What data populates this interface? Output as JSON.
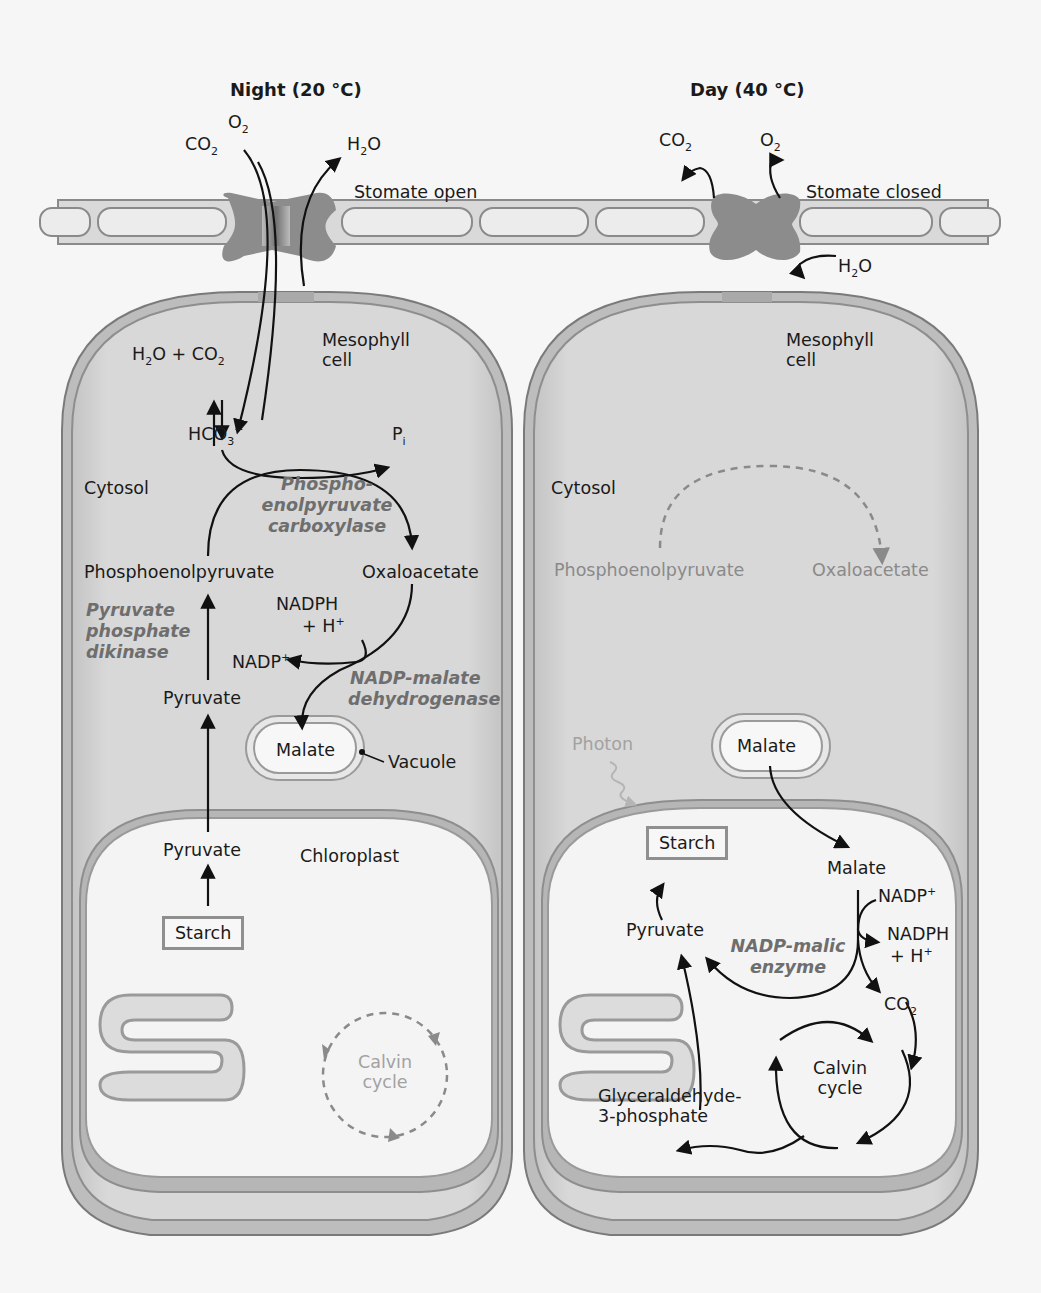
{
  "panels": {
    "night": {
      "title": "Night (20 °C)",
      "gases": {
        "o2": "O",
        "o2_sub": "2",
        "co2": "CO",
        "co2_sub": "2",
        "h2o_h": "H",
        "h2o_sub": "2",
        "h2o_o": "O"
      },
      "stomate_label": "Stomate open",
      "cell_label_line1": "Mesophyll",
      "cell_label_line2": "cell",
      "cytosol_label": "Cytosol",
      "reaction_h2o_co2": {
        "h": "H",
        "sub1": "2",
        "mid": "O + CO",
        "sub2": "2"
      },
      "hco3": {
        "main": "HCO",
        "sub": "3",
        "sup": "−"
      },
      "pi": {
        "main": "P",
        "sub": "i"
      },
      "enzyme_pepc": [
        "Phospho-",
        "enolpyruvate",
        "carboxylase"
      ],
      "phosphoenolpyruvate": "Phosphoenolpyruvate",
      "oxaloacetate": "Oxaloacetate",
      "nadph": "NADPH",
      "h_plus": "+ H",
      "h_plus_sup": "+",
      "nadp": "NADP",
      "nadp_sup": "+",
      "enzyme_ppdk": [
        "Pyruvate",
        "phosphate",
        "dikinase"
      ],
      "enzyme_nadp_mdh": [
        "NADP-malate",
        "dehydrogenase"
      ],
      "pyruvate_cytosol": "Pyruvate",
      "malate": "Malate",
      "vacuole": "Vacuole",
      "pyruvate_chloroplast": "Pyruvate",
      "chloroplast": "Chloroplast",
      "starch": "Starch",
      "calvin_line1": "Calvin",
      "calvin_line2": "cycle"
    },
    "day": {
      "title": "Day (40 °C)",
      "gases": {
        "co2": "CO",
        "co2_sub": "2",
        "o2": "O",
        "o2_sub": "2",
        "h2o_h": "H",
        "h2o_sub": "2",
        "h2o_o": "O"
      },
      "stomate_label": "Stomate closed",
      "cell_label_line1": "Mesophyll",
      "cell_label_line2": "cell",
      "cytosol_label": "Cytosol",
      "phosphoenolpyruvate": "Phosphoenolpyruvate",
      "oxaloacetate": "Oxaloacetate",
      "photon": "Photon",
      "malate_vacuole": "Malate",
      "starch": "Starch",
      "malate_chloroplast": "Malate",
      "nadp": "NADP",
      "nadp_sup": "+",
      "nadph": "NADPH",
      "h_plus": "+ H",
      "h_plus_sup": "+",
      "pyruvate": "Pyruvate",
      "enzyme_malic": [
        "NADP-malic",
        "enzyme"
      ],
      "co2": "CO",
      "co2_sub": "2",
      "calvin_line1": "Calvin",
      "calvin_line2": "cycle",
      "g3p_line1": "Glyceraldehyde-",
      "g3p_line2": "3-phosphate"
    }
  },
  "colors": {
    "cell_fill": "#d6d6d6",
    "cell_border": "#7a7a7a",
    "chloroplast_fill": "#f3f3f3",
    "stomate": "#8c8c8c",
    "enzyme_text": "#6e6e6e",
    "arrow": "#111111",
    "inactive": "#8a8a8a"
  }
}
